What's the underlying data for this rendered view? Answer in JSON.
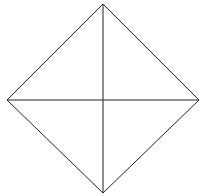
{
  "diagram": {
    "shape": "diamond-with-diagonals",
    "stroke_color": "#222222",
    "background": "#ffffff",
    "vertices": {
      "top": [
        103,
        4
      ],
      "right": [
        199,
        100
      ],
      "bottom": [
        103,
        193
      ],
      "left": [
        7,
        100
      ]
    },
    "center": [
      103,
      100
    ],
    "top_text_cut_off": ""
  }
}
